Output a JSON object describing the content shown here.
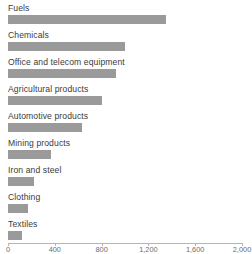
{
  "chart_data": {
    "type": "bar",
    "orientation": "horizontal",
    "title": "",
    "subtitle": "",
    "xlabel": "",
    "ylabel": "",
    "categories": [
      "Fuels",
      "Chemicals",
      "Office and telecom equipment",
      "Agricultural products",
      "Automotive products",
      "Mining products",
      "Iron and steel",
      "Clothing",
      "Textiles"
    ],
    "values": [
      1350,
      1000,
      920,
      800,
      630,
      370,
      220,
      175,
      120
    ],
    "xlim": [
      0,
      2000
    ],
    "ylim": null,
    "xticks": [
      0,
      400,
      800,
      1200,
      1600,
      2000
    ],
    "xtick_labels": [
      "0",
      "400",
      "800",
      "1,200",
      "1,600",
      "2,000"
    ],
    "grid": false,
    "legend": null,
    "legend_position": "none",
    "bar_color": "#9a9a9a",
    "axis_color": "#b4b4b4",
    "label_color": "#3b3b3b",
    "tick_label_color": "#6e6e6e",
    "background_color": "#ffffff",
    "annotations": []
  }
}
